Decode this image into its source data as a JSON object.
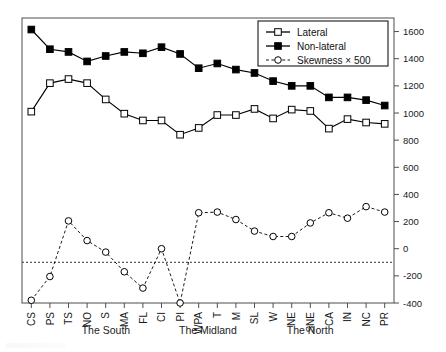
{
  "chart_data": {
    "type": "line",
    "title": "",
    "xlabel": "",
    "ylabel": "",
    "ylim": [
      -400,
      1700
    ],
    "yticks": [
      -400,
      -200,
      0,
      200,
      400,
      600,
      800,
      1000,
      1200,
      1400,
      1600
    ],
    "ytick_labels": [
      "-400",
      "-200",
      "0",
      "200",
      "400",
      "600",
      "800",
      "1000",
      "1200",
      "1400",
      "1600"
    ],
    "y_axis_position": "right",
    "grid": false,
    "reference_line": {
      "value": -100,
      "style": "dashed",
      "label": ""
    },
    "legend_position": "top-right",
    "categories": [
      "CS",
      "PS",
      "TS",
      "NO",
      "S",
      "MA",
      "FL",
      "CI",
      "PI",
      "WPA",
      "T",
      "M",
      "SL",
      "W",
      "NE",
      "SNE",
      "CA",
      "IN",
      "NC",
      "PR"
    ],
    "series": [
      {
        "name": "Lateral",
        "marker": "open-square",
        "line": "solid",
        "color": "#000000",
        "values": [
          1010,
          1220,
          1250,
          1220,
          1100,
          995,
          945,
          945,
          840,
          890,
          985,
          985,
          1030,
          960,
          1025,
          1015,
          885,
          955,
          930,
          920
        ]
      },
      {
        "name": "Non-lateral",
        "marker": "filled-square",
        "line": "solid",
        "color": "#000000",
        "values": [
          1615,
          1470,
          1450,
          1380,
          1420,
          1450,
          1440,
          1485,
          1435,
          1330,
          1365,
          1320,
          1295,
          1235,
          1200,
          1200,
          1115,
          1115,
          1095,
          1055
        ]
      },
      {
        "name": "Skewness × 500",
        "marker": "open-circle",
        "line": "dashed",
        "color": "#000000",
        "values": [
          -380,
          -205,
          205,
          60,
          -25,
          -170,
          -290,
          0,
          -400,
          265,
          270,
          215,
          130,
          90,
          90,
          190,
          265,
          225,
          310,
          270
        ]
      }
    ],
    "groups": [
      {
        "label": "The South",
        "start": "CS",
        "end": "PI"
      },
      {
        "label": "The Midland",
        "start": "WPA",
        "end": "T"
      },
      {
        "label": "The North",
        "start": "M",
        "end": "PR"
      }
    ]
  },
  "legend": {
    "items": [
      {
        "label": "Lateral"
      },
      {
        "label": "Non-lateral"
      },
      {
        "label": "Skewness × 500"
      }
    ]
  },
  "groups": {
    "south": "The South",
    "midland": "The Midland",
    "north": "The North"
  }
}
